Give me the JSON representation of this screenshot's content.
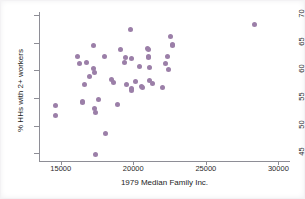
{
  "figure": {
    "background": "#ffffff",
    "point_color": "#9b7fa8",
    "axis_color": "#8e8e96"
  },
  "chart_data": {
    "type": "scatter",
    "title": "",
    "xlabel": "1979 Median Family Inc.",
    "ylabel": "% HHs with 2+ workers",
    "xlim": [
      13500,
      30800
    ],
    "ylim": [
      43.6,
      70.6
    ],
    "xticks": [
      15000,
      20000,
      25000,
      30000
    ],
    "xtick_labels": [
      "15000",
      "20000",
      "25000",
      "30000"
    ],
    "yticks": [
      45,
      50,
      55,
      60,
      65,
      70
    ],
    "ytick_labels": [
      "45",
      "50",
      "55",
      "60",
      "65",
      "70"
    ],
    "grid": false,
    "legend": null,
    "marker": "circle",
    "series": [
      {
        "name": "observations",
        "points": [
          [
            14620,
            53.6
          ],
          [
            14640,
            51.8
          ],
          [
            16130,
            62.5
          ],
          [
            16260,
            61.3
          ],
          [
            16470,
            54.4
          ],
          [
            16520,
            54.2
          ],
          [
            16640,
            57.4
          ],
          [
            16800,
            61.4
          ],
          [
            17000,
            59.0
          ],
          [
            17280,
            64.5
          ],
          [
            17260,
            60.4
          ],
          [
            17320,
            59.7
          ],
          [
            17330,
            53.1
          ],
          [
            17420,
            52.3
          ],
          [
            17420,
            44.8
          ],
          [
            17580,
            54.8
          ],
          [
            17990,
            62.6
          ],
          [
            18110,
            48.5
          ],
          [
            18500,
            58.3
          ],
          [
            18640,
            57.9
          ],
          [
            18930,
            53.8
          ],
          [
            19100,
            63.8
          ],
          [
            19410,
            61.4
          ],
          [
            19440,
            62.3
          ],
          [
            19560,
            57.5
          ],
          [
            19840,
            67.5
          ],
          [
            19880,
            62.1
          ],
          [
            19890,
            56.7
          ],
          [
            19900,
            56.3
          ],
          [
            20160,
            58.0
          ],
          [
            20430,
            60.7
          ],
          [
            20560,
            57.1
          ],
          [
            20600,
            57.0
          ],
          [
            20980,
            64.0
          ],
          [
            21020,
            63.8
          ],
          [
            21040,
            62.6
          ],
          [
            21060,
            62.4
          ],
          [
            21140,
            60.5
          ],
          [
            21140,
            58.2
          ],
          [
            21330,
            57.6
          ],
          [
            22020,
            57.0
          ],
          [
            22240,
            61.2
          ],
          [
            22390,
            62.5
          ],
          [
            22430,
            60.2
          ],
          [
            22530,
            66.2
          ],
          [
            22700,
            64.8
          ],
          [
            22730,
            64.5
          ],
          [
            28330,
            68.3
          ]
        ]
      }
    ]
  }
}
